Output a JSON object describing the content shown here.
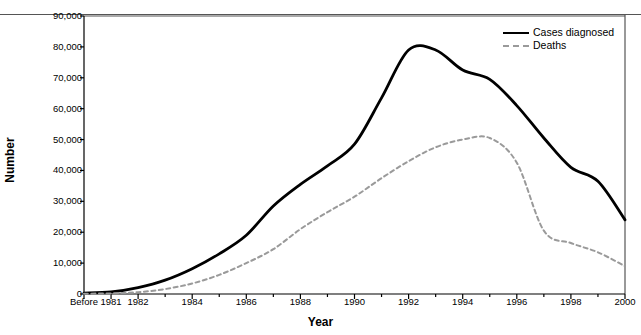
{
  "chart_data": {
    "type": "line",
    "title": "",
    "xlabel": "Year",
    "ylabel": "Number",
    "ylim": [
      0,
      90000
    ],
    "ytick_values": [
      0,
      10000,
      20000,
      30000,
      40000,
      50000,
      60000,
      70000,
      80000,
      90000
    ],
    "ytick_labels": [
      "0",
      "10,000",
      "20,000",
      "30,000",
      "40,000",
      "50,000",
      "60,000",
      "70,000",
      "80,000",
      "90,000"
    ],
    "grid": false,
    "legend_position": "top-right",
    "x": [
      "Before",
      "1981",
      "1982",
      "1983",
      "1984",
      "1985",
      "1986",
      "1987",
      "1988",
      "1989",
      "1990",
      "1991",
      "1992",
      "1993",
      "1994",
      "1995",
      "1996",
      "1997",
      "1998",
      "1999",
      "2000"
    ],
    "xtick_labels": [
      "Before",
      "1981",
      "1982",
      "1984",
      "1986",
      "1988",
      "1990",
      "1992",
      "1994",
      "1996",
      "1998",
      "2000"
    ],
    "series": [
      {
        "name": "Cases diagnosed",
        "style": "solid",
        "color": "#000000",
        "values": [
          300,
          700,
          2100,
          4500,
          8200,
          13000,
          19000,
          28500,
          35500,
          41500,
          48500,
          63500,
          79000,
          79000,
          72500,
          69500,
          61000,
          50500,
          41000,
          36500,
          24000
        ]
      },
      {
        "name": "Deaths",
        "style": "dashed",
        "color": "#9a9a9a",
        "values": [
          100,
          200,
          600,
          1600,
          3400,
          6200,
          10000,
          14500,
          21000,
          26500,
          31500,
          37500,
          43000,
          47500,
          50000,
          50500,
          42500,
          20500,
          16500,
          13500,
          9000
        ]
      }
    ]
  },
  "axes": {
    "y_title": "Number",
    "x_title": "Year"
  },
  "legend": {
    "entries": [
      {
        "label": "Cases diagnosed",
        "style": "solid"
      },
      {
        "label": "Deaths",
        "style": "dashed"
      }
    ]
  },
  "colors": {
    "cases_line": "#000000",
    "deaths_line": "#9a9a9a",
    "axis": "#000000",
    "frame": "#555555"
  },
  "cut_header_text": ""
}
